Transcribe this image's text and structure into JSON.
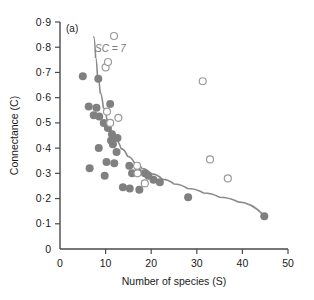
{
  "panel": {
    "label": "(a)"
  },
  "annotation": {
    "text": "SC = 7",
    "marker": "open-circle"
  },
  "chart_data": {
    "type": "scatter",
    "title": "",
    "xlabel": "Number of species (S)",
    "ylabel": "Connectance (C)",
    "xlim": [
      0,
      50
    ],
    "ylim": [
      0,
      0.9
    ],
    "xticks": [
      0,
      10,
      20,
      30,
      40,
      50
    ],
    "xticklabels": [
      "0",
      "10",
      "20",
      "30",
      "40",
      "50"
    ],
    "yticks": [
      0,
      0.1,
      0.2,
      0.3,
      0.4,
      0.5,
      0.6,
      0.7,
      0.8,
      0.9
    ],
    "yticklabels": [
      "0",
      "0·1",
      "0·2",
      "0·3",
      "0·4",
      "0·5",
      "0·6",
      "0·7",
      "0·8",
      "0·9"
    ],
    "grid": false,
    "legend": false,
    "marker_colors": {
      "filled": "#808080",
      "open_stroke": "#9a9a9a",
      "curve": "#8a8a8a"
    },
    "series": [
      {
        "name": "filled",
        "marker": "filled-circle",
        "points": [
          [
            5.0,
            0.685
          ],
          [
            8.4,
            0.675
          ],
          [
            6.3,
            0.565
          ],
          [
            8.0,
            0.56
          ],
          [
            7.4,
            0.53
          ],
          [
            8.6,
            0.525
          ],
          [
            11.0,
            0.575
          ],
          [
            9.6,
            0.5
          ],
          [
            10.5,
            0.48
          ],
          [
            11.4,
            0.455
          ],
          [
            11.2,
            0.43
          ],
          [
            11.6,
            0.415
          ],
          [
            12.6,
            0.44
          ],
          [
            8.5,
            0.4
          ],
          [
            12.4,
            0.385
          ],
          [
            10.2,
            0.345
          ],
          [
            11.9,
            0.34
          ],
          [
            6.5,
            0.32
          ],
          [
            9.8,
            0.29
          ],
          [
            15.2,
            0.33
          ],
          [
            15.8,
            0.3
          ],
          [
            17.1,
            0.305
          ],
          [
            18.6,
            0.3
          ],
          [
            19.4,
            0.29
          ],
          [
            20.5,
            0.275
          ],
          [
            13.8,
            0.245
          ],
          [
            15.3,
            0.24
          ],
          [
            17.4,
            0.235
          ],
          [
            21.9,
            0.265
          ],
          [
            28.1,
            0.205
          ],
          [
            44.8,
            0.13
          ]
        ]
      },
      {
        "name": "open",
        "marker": "open-circle",
        "points": [
          [
            10.0,
            0.72
          ],
          [
            10.3,
            0.545
          ],
          [
            12.8,
            0.52
          ],
          [
            11.0,
            0.5
          ],
          [
            16.9,
            0.33
          ],
          [
            17.0,
            0.3
          ],
          [
            18.6,
            0.26
          ],
          [
            31.3,
            0.665
          ],
          [
            32.9,
            0.355
          ],
          [
            36.8,
            0.28
          ]
        ]
      }
    ],
    "fit_curve": {
      "name": "fitted-curve",
      "points": [
        [
          7.4,
          0.84
        ],
        [
          7.8,
          0.76
        ],
        [
          8.2,
          0.69
        ],
        [
          8.8,
          0.62
        ],
        [
          9.5,
          0.56
        ],
        [
          10.3,
          0.512
        ],
        [
          11.2,
          0.47
        ],
        [
          12.2,
          0.432
        ],
        [
          13.4,
          0.398
        ],
        [
          14.8,
          0.368
        ],
        [
          16.3,
          0.342
        ],
        [
          18.0,
          0.319
        ],
        [
          20.0,
          0.298
        ],
        [
          22.5,
          0.276
        ],
        [
          25.0,
          0.258
        ],
        [
          28.0,
          0.24
        ],
        [
          31.5,
          0.222
        ],
        [
          35.0,
          0.205
        ],
        [
          39.0,
          0.187
        ],
        [
          44.8,
          0.132
        ]
      ]
    }
  }
}
